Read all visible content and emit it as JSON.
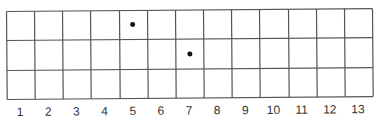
{
  "diagram": {
    "type": "grid",
    "columns": 13,
    "rows": 3,
    "column_labels": [
      "1",
      "2",
      "3",
      "4",
      "5",
      "6",
      "7",
      "8",
      "9",
      "10",
      "11",
      "12",
      "13"
    ],
    "dots": [
      {
        "column": 5,
        "row": 1
      },
      {
        "column": 7,
        "row": 2
      }
    ],
    "line_color": "#555555",
    "dot_color": "#111111"
  }
}
